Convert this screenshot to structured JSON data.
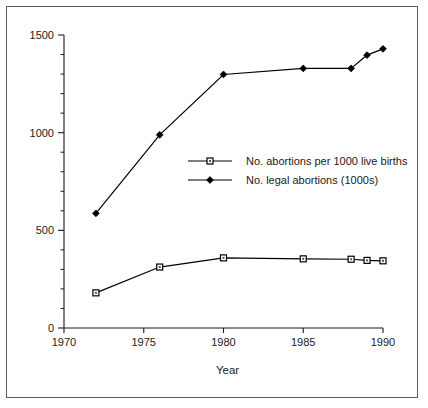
{
  "chart_data": {
    "type": "line",
    "title": "",
    "xlabel": "Year",
    "ylabel": "",
    "xlim": [
      1970,
      1990
    ],
    "ylim": [
      0,
      1500
    ],
    "x_ticks": [
      1970,
      1975,
      1980,
      1985,
      1990
    ],
    "x_tick_labels": [
      "1970",
      "1975",
      "1980",
      "1985",
      "1990"
    ],
    "y_ticks": [
      0,
      500,
      1000,
      1500
    ],
    "y_tick_labels": [
      "0",
      "500",
      "1000",
      "1500"
    ],
    "y_minor_tick_interval": 100,
    "grid": false,
    "legend_position": "center",
    "series": [
      {
        "name": "No. abortions per 1000 live births",
        "marker": "open-square",
        "x": [
          1972,
          1976,
          1980,
          1985,
          1988,
          1989,
          1990
        ],
        "values": [
          180,
          312,
          359,
          354,
          352,
          346,
          344
        ]
      },
      {
        "name": "No. legal abortions (1000s)",
        "marker": "filled-diamond",
        "x": [
          1972,
          1976,
          1980,
          1985,
          1988,
          1989,
          1990
        ],
        "values": [
          587,
          989,
          1298,
          1329,
          1329,
          1397,
          1429
        ]
      }
    ],
    "colors": {
      "line": "#000000",
      "axis": "#1a1a1a",
      "frame": "#5a5a5a",
      "background": "#ffffff"
    }
  },
  "legend": {
    "entries": [
      {
        "label": "No. abortions per 1000 live births"
      },
      {
        "label": "No. legal abortions (1000s)"
      }
    ]
  },
  "axes": {
    "x_title": "Year"
  }
}
